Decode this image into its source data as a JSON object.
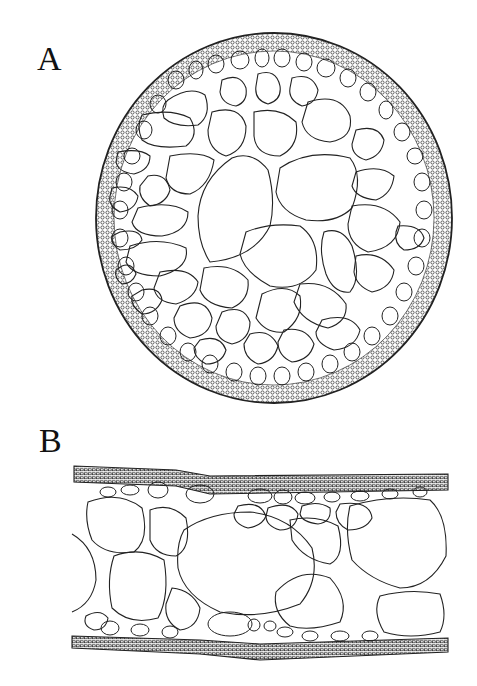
{
  "panels": [
    {
      "label": "A",
      "description": "Circular transverse section with outer dense cortex ring of small cells and large irregular inner air chambers (aerenchyma)"
    },
    {
      "label": "B",
      "description": "Longitudinal/flattened strip section with dense upper and lower epidermal layers and large rounded air chambers between"
    }
  ],
  "style": {
    "stroke": "#222222",
    "background": "#ffffff"
  }
}
